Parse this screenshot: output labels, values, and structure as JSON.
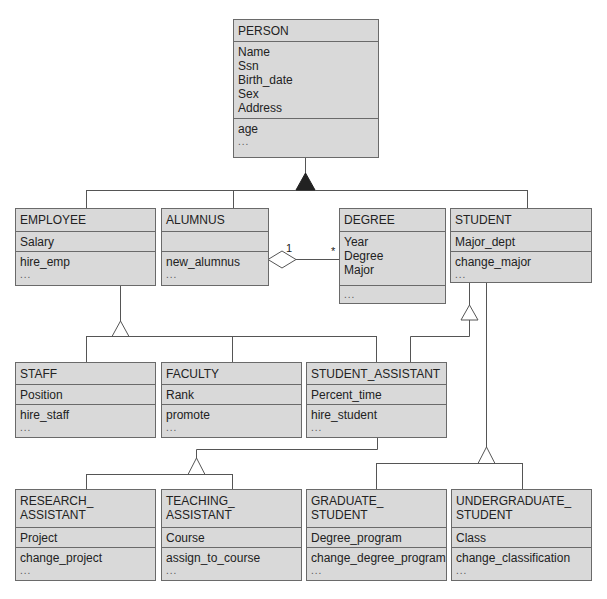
{
  "diagram": {
    "type": "UML class diagram",
    "classes": {
      "person": {
        "name": "PERSON",
        "attributes": [
          "Name",
          "Ssn",
          "Birth_date",
          "Sex",
          "Address"
        ],
        "operations": [
          "age",
          "..."
        ]
      },
      "employee": {
        "name": "EMPLOYEE",
        "attributes": [
          "Salary"
        ],
        "operations": [
          "hire_emp",
          "..."
        ]
      },
      "alumnus": {
        "name": "ALUMNUS",
        "attributes": [],
        "operations": [
          "new_alumnus",
          "..."
        ]
      },
      "degree": {
        "name": "DEGREE",
        "attributes": [
          "Year",
          "Degree",
          "Major"
        ],
        "operations": [
          "..."
        ]
      },
      "student": {
        "name": "STUDENT",
        "attributes": [
          "Major_dept"
        ],
        "operations": [
          "change_major",
          "..."
        ]
      },
      "staff": {
        "name": "STAFF",
        "attributes": [
          "Position"
        ],
        "operations": [
          "hire_staff",
          "..."
        ]
      },
      "faculty": {
        "name": "FACULTY",
        "attributes": [
          "Rank"
        ],
        "operations": [
          "promote",
          "..."
        ]
      },
      "student_assistant": {
        "name": "STUDENT_ASSISTANT",
        "attributes": [
          "Percent_time"
        ],
        "operations": [
          "hire_student",
          "..."
        ]
      },
      "research_assistant": {
        "name_lines": [
          "RESEARCH_",
          "ASSISTANT"
        ],
        "attributes": [
          "Project"
        ],
        "operations": [
          "change_project",
          "..."
        ]
      },
      "teaching_assistant": {
        "name_lines": [
          "TEACHING_",
          "ASSISTANT"
        ],
        "attributes": [
          "Course"
        ],
        "operations": [
          "assign_to_course",
          "..."
        ]
      },
      "graduate_student": {
        "name_lines": [
          "GRADUATE_",
          "STUDENT"
        ],
        "attributes": [
          "Degree_program"
        ],
        "operations": [
          "change_degree_program",
          "..."
        ]
      },
      "undergraduate_student": {
        "name_lines": [
          "UNDERGRADUATE_",
          "STUDENT"
        ],
        "attributes": [
          "Class"
        ],
        "operations": [
          "change_classification",
          "..."
        ]
      }
    },
    "association": {
      "from": "ALUMNUS",
      "to": "DEGREE",
      "kind": "aggregation",
      "multiplicity_from": "1",
      "multiplicity_to": "*"
    },
    "generalizations": [
      {
        "parent": "PERSON",
        "children": [
          "EMPLOYEE",
          "ALUMNUS",
          "STUDENT"
        ],
        "marker": "filled-triangle"
      },
      {
        "parent": "EMPLOYEE",
        "children": [
          "STAFF",
          "FACULTY",
          "STUDENT_ASSISTANT"
        ],
        "marker": "hollow-triangle"
      },
      {
        "parent": "STUDENT",
        "children": [
          "STUDENT_ASSISTANT"
        ],
        "marker": "hollow-triangle"
      },
      {
        "parent": "STUDENT_ASSISTANT",
        "children": [
          "RESEARCH_ASSISTANT",
          "TEACHING_ASSISTANT"
        ],
        "marker": "hollow-triangle"
      },
      {
        "parent": "STUDENT",
        "children": [
          "GRADUATE_STUDENT",
          "UNDERGRADUATE_STUDENT"
        ],
        "marker": "hollow-triangle"
      }
    ],
    "colors": {
      "box_fill": "#d9d9d9",
      "box_border": "#6a6a6a",
      "line": "#555555",
      "text": "#222222"
    }
  }
}
